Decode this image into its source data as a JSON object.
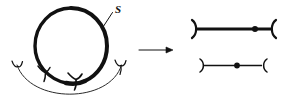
{
  "figure": {
    "kind": "mathematical-diagram",
    "background_color": "#ffffff",
    "ink_color": "#111111",
    "labels": {
      "curve_label": "S"
    },
    "left_panel": {
      "name": "source-configuration",
      "circle": {
        "name": "thick-circle",
        "center_x": 71,
        "center_y": 46,
        "radius_x": 36,
        "radius_y": 38,
        "stroke_width_max": 4.2,
        "stroke_width_min": 2.0
      },
      "leader_line": {
        "name": "label-leader-line",
        "from_x": 103,
        "from_y": 26,
        "to_x": 112,
        "to_y": 12
      },
      "label_position": {
        "x": 115,
        "y": 12
      },
      "arc": {
        "name": "thin-lower-arc",
        "start_x": 17,
        "start_y": 66,
        "end_x": 122,
        "end_y": 66,
        "sag_y": 104,
        "stroke_width": 1.0
      },
      "fork_marks": [
        {
          "name": "fork-left-end",
          "x": 17,
          "y": 64,
          "angle": -95
        },
        {
          "name": "fork-inner-left",
          "x": 44,
          "y": 72,
          "angle": -35
        },
        {
          "name": "fork-inner-right",
          "x": 74,
          "y": 79,
          "angle": -8
        },
        {
          "name": "fork-right-end",
          "x": 121,
          "y": 64,
          "angle": -88
        }
      ]
    },
    "arrow": {
      "name": "transformation-arrow",
      "x1": 139,
      "y1": 50,
      "x2": 172,
      "y2": 50,
      "stroke_width": 1.0,
      "head_size": 6
    },
    "right_panel": {
      "name": "target-configuration",
      "segments": [
        {
          "name": "upper-segment",
          "x_start": 196,
          "x_end": 272,
          "y": 29,
          "stroke_width": 3.2,
          "left_bracket": "right-paren",
          "right_bracket": "left-paren",
          "bracket_height": 17,
          "dot": {
            "name": "marked-point",
            "x": 255,
            "y": 29,
            "radius": 3.0
          }
        },
        {
          "name": "lower-segment",
          "x_start": 203,
          "x_end": 263,
          "y": 65,
          "stroke_width": 1.4,
          "left_bracket": "right-paren",
          "right_bracket": "left-paren",
          "bracket_height": 13,
          "dot": {
            "name": "marked-point",
            "x": 237,
            "y": 65,
            "radius": 2.8
          }
        }
      ]
    }
  }
}
